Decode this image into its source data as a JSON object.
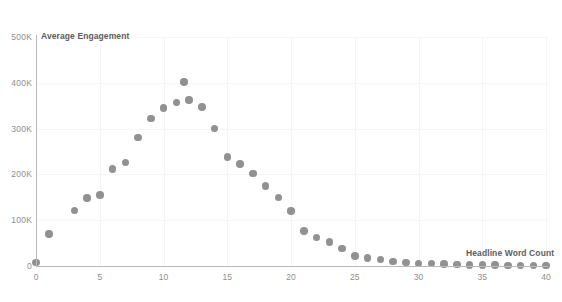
{
  "chart_data": {
    "type": "scatter",
    "title": "",
    "xlabel": "Headline Word Count",
    "ylabel": "Average Engagement",
    "xlim": [
      0,
      40
    ],
    "ylim": [
      0,
      500000
    ],
    "grid": true,
    "legend": false,
    "point_color": "#919191",
    "axis_color": "#b9b9b9",
    "gridline_color": "#f4f4f4",
    "tick_label_color": "#8e8e8e",
    "axis_title_color": "#5d5d5d",
    "background": "#ffffff",
    "x_ticks": [
      0,
      5,
      10,
      15,
      20,
      25,
      30,
      35,
      40
    ],
    "x_tick_labels": [
      "0",
      "5",
      "10",
      "15",
      "20",
      "25",
      "30",
      "35",
      "40"
    ],
    "y_ticks": [
      0,
      100000,
      200000,
      300000,
      400000,
      500000
    ],
    "y_tick_labels": [
      "0",
      "100K",
      "200K",
      "300K",
      "400K",
      "500K"
    ],
    "series": [
      {
        "name": "Average Engagement",
        "points": [
          {
            "x": 0,
            "y": 8000
          },
          {
            "x": 1,
            "y": 70000
          },
          {
            "x": 3,
            "y": 121000
          },
          {
            "x": 4,
            "y": 148000
          },
          {
            "x": 5,
            "y": 155000
          },
          {
            "x": 6,
            "y": 212000
          },
          {
            "x": 7,
            "y": 226000
          },
          {
            "x": 8,
            "y": 281000
          },
          {
            "x": 9,
            "y": 322000
          },
          {
            "x": 10,
            "y": 345000
          },
          {
            "x": 11,
            "y": 357000
          },
          {
            "x": 11.6,
            "y": 402000
          },
          {
            "x": 12,
            "y": 362000
          },
          {
            "x": 13,
            "y": 347000
          },
          {
            "x": 14,
            "y": 300000
          },
          {
            "x": 15,
            "y": 238000
          },
          {
            "x": 16,
            "y": 223000
          },
          {
            "x": 17,
            "y": 202000
          },
          {
            "x": 18,
            "y": 175000
          },
          {
            "x": 19,
            "y": 150000
          },
          {
            "x": 20,
            "y": 120000
          },
          {
            "x": 21,
            "y": 76000
          },
          {
            "x": 22,
            "y": 62000
          },
          {
            "x": 23,
            "y": 52000
          },
          {
            "x": 24,
            "y": 38000
          },
          {
            "x": 25,
            "y": 22000
          },
          {
            "x": 26,
            "y": 18000
          },
          {
            "x": 27,
            "y": 14000
          },
          {
            "x": 28,
            "y": 10000
          },
          {
            "x": 29,
            "y": 8000
          },
          {
            "x": 30,
            "y": 6000
          },
          {
            "x": 31,
            "y": 5000
          },
          {
            "x": 32,
            "y": 4000
          },
          {
            "x": 33,
            "y": 3000
          },
          {
            "x": 34,
            "y": 2500
          },
          {
            "x": 35,
            "y": 2000
          },
          {
            "x": 36,
            "y": 1800
          },
          {
            "x": 37,
            "y": 1500
          },
          {
            "x": 38,
            "y": 1300
          },
          {
            "x": 39,
            "y": 1100
          },
          {
            "x": 40,
            "y": 1000
          }
        ]
      }
    ]
  }
}
